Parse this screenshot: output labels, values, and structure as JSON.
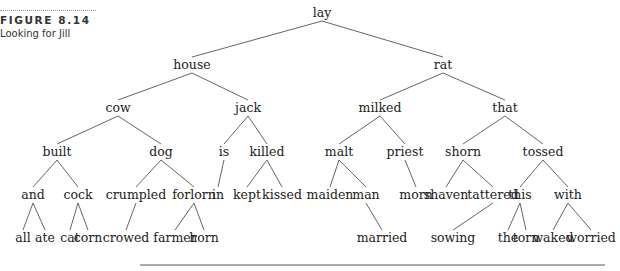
{
  "figure": {
    "number": "FIGURE 8.14",
    "title": "Looking for Jill"
  },
  "tree": {
    "root": "lay",
    "nodes": [
      {
        "id": "lay",
        "label": "lay",
        "x": 322,
        "y": 17
      },
      {
        "id": "house",
        "label": "house",
        "x": 192,
        "y": 69
      },
      {
        "id": "rat",
        "label": "rat",
        "x": 443,
        "y": 69
      },
      {
        "id": "cow",
        "label": "cow",
        "x": 118,
        "y": 112
      },
      {
        "id": "jack",
        "label": "jack",
        "x": 248,
        "y": 112
      },
      {
        "id": "milked",
        "label": "milked",
        "x": 380,
        "y": 112
      },
      {
        "id": "that",
        "label": "that",
        "x": 505,
        "y": 112
      },
      {
        "id": "built",
        "label": "built",
        "x": 57,
        "y": 156
      },
      {
        "id": "dog",
        "label": "dog",
        "x": 161,
        "y": 156
      },
      {
        "id": "is",
        "label": "is",
        "x": 224,
        "y": 156
      },
      {
        "id": "killed",
        "label": "killed",
        "x": 267,
        "y": 156
      },
      {
        "id": "malt",
        "label": "malt",
        "x": 339,
        "y": 156
      },
      {
        "id": "priest",
        "label": "priest",
        "x": 405,
        "y": 156
      },
      {
        "id": "shorn",
        "label": "shorn",
        "x": 463,
        "y": 156
      },
      {
        "id": "tossed",
        "label": "tossed",
        "x": 543,
        "y": 156
      },
      {
        "id": "and",
        "label": "and",
        "x": 33,
        "y": 199
      },
      {
        "id": "cock",
        "label": "cock",
        "x": 78,
        "y": 199
      },
      {
        "id": "crumpled",
        "label": "crumpled",
        "x": 136,
        "y": 199
      },
      {
        "id": "forlorn",
        "label": "forlorn",
        "x": 194,
        "y": 199
      },
      {
        "id": "in",
        "label": "in",
        "x": 218,
        "y": 199
      },
      {
        "id": "kept",
        "label": "kept",
        "x": 247,
        "y": 199
      },
      {
        "id": "kissed",
        "label": "kissed",
        "x": 282,
        "y": 199
      },
      {
        "id": "maiden",
        "label": "maiden",
        "x": 330,
        "y": 199
      },
      {
        "id": "man",
        "label": "man",
        "x": 366,
        "y": 199
      },
      {
        "id": "morn",
        "label": "morn",
        "x": 416,
        "y": 199
      },
      {
        "id": "shaven",
        "label": "shaven",
        "x": 446,
        "y": 199
      },
      {
        "id": "tattered",
        "label": "tattered",
        "x": 493,
        "y": 199
      },
      {
        "id": "this",
        "label": "this",
        "x": 520,
        "y": 199
      },
      {
        "id": "with",
        "label": "with",
        "x": 568,
        "y": 199
      },
      {
        "id": "all",
        "label": "all",
        "x": 23,
        "y": 242
      },
      {
        "id": "ate",
        "label": "ate",
        "x": 45,
        "y": 242
      },
      {
        "id": "cat",
        "label": "cat",
        "x": 70,
        "y": 242
      },
      {
        "id": "corn",
        "label": "corn",
        "x": 88,
        "y": 242
      },
      {
        "id": "crowed",
        "label": "crowed",
        "x": 126,
        "y": 242
      },
      {
        "id": "farmer",
        "label": "farmer",
        "x": 175,
        "y": 242
      },
      {
        "id": "horn",
        "label": "horn",
        "x": 204,
        "y": 242
      },
      {
        "id": "married",
        "label": "married",
        "x": 382,
        "y": 242
      },
      {
        "id": "sowing",
        "label": "sowing",
        "x": 453,
        "y": 242
      },
      {
        "id": "the",
        "label": "the",
        "x": 508,
        "y": 242
      },
      {
        "id": "torn",
        "label": "torn",
        "x": 526,
        "y": 242
      },
      {
        "id": "waked",
        "label": "waked",
        "x": 553,
        "y": 242
      },
      {
        "id": "worried",
        "label": "worried",
        "x": 591,
        "y": 242
      }
    ],
    "edges": [
      [
        "lay",
        "house"
      ],
      [
        "lay",
        "rat"
      ],
      [
        "house",
        "cow"
      ],
      [
        "house",
        "jack"
      ],
      [
        "rat",
        "milked"
      ],
      [
        "rat",
        "that"
      ],
      [
        "cow",
        "built"
      ],
      [
        "cow",
        "dog"
      ],
      [
        "jack",
        "is"
      ],
      [
        "jack",
        "killed"
      ],
      [
        "milked",
        "malt"
      ],
      [
        "milked",
        "priest"
      ],
      [
        "that",
        "shorn"
      ],
      [
        "that",
        "tossed"
      ],
      [
        "built",
        "and"
      ],
      [
        "built",
        "cock"
      ],
      [
        "dog",
        "crumpled"
      ],
      [
        "dog",
        "forlorn"
      ],
      [
        "is",
        "in"
      ],
      [
        "killed",
        "kept"
      ],
      [
        "killed",
        "kissed"
      ],
      [
        "malt",
        "maiden"
      ],
      [
        "malt",
        "man"
      ],
      [
        "priest",
        "morn"
      ],
      [
        "shorn",
        "shaven"
      ],
      [
        "shorn",
        "tattered"
      ],
      [
        "tossed",
        "this"
      ],
      [
        "tossed",
        "with"
      ],
      [
        "and",
        "all"
      ],
      [
        "and",
        "ate"
      ],
      [
        "cock",
        "cat"
      ],
      [
        "cock",
        "corn"
      ],
      [
        "crumpled",
        "crowed"
      ],
      [
        "forlorn",
        "farmer"
      ],
      [
        "forlorn",
        "horn"
      ],
      [
        "man",
        "married"
      ],
      [
        "tattered",
        "sowing"
      ],
      [
        "this",
        "the"
      ],
      [
        "this",
        "torn"
      ],
      [
        "with",
        "waked"
      ],
      [
        "with",
        "worried"
      ]
    ]
  },
  "footer_rule": {
    "x1": 140,
    "x2": 605,
    "y": 265
  }
}
